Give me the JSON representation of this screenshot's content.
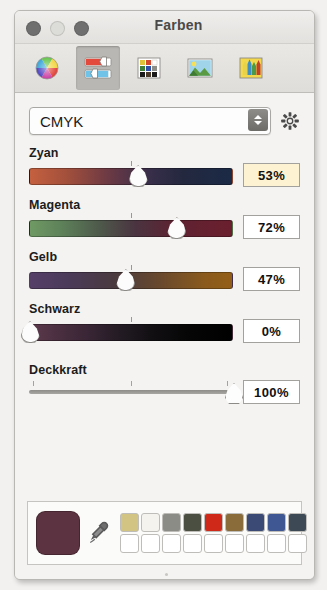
{
  "window": {
    "title": "Farben",
    "controls": [
      {
        "name": "close",
        "color": "#6f6f6f"
      },
      {
        "name": "minimize",
        "color": "#dcdcd8"
      },
      {
        "name": "zoom",
        "color": "#6f6f6f"
      }
    ]
  },
  "toolbar": {
    "items": [
      {
        "id": "color-wheel",
        "icon": "color-wheel-icon",
        "selected": false
      },
      {
        "id": "color-sliders",
        "icon": "sliders-icon",
        "selected": true
      },
      {
        "id": "color-palettes",
        "icon": "palette-grid-icon",
        "selected": false
      },
      {
        "id": "image-palettes",
        "icon": "image-icon",
        "selected": false
      },
      {
        "id": "crayons",
        "icon": "crayons-icon",
        "selected": false
      }
    ]
  },
  "model_selector": {
    "value": "CMYK",
    "options": [
      "Graustufen",
      "RGB-Schieberegler",
      "CMYK",
      "HSB-Schieberegler"
    ],
    "gear_icon": "gear-icon"
  },
  "sliders": [
    {
      "label": "Zyan",
      "value": "53%",
      "percent": 53,
      "focused": true,
      "gradient": "linear-gradient(to right, #c4603f 0%, #a3503c 18%, #6e3a44 38%, #3a2f4a 58%, #23283f 76%, #1b2a46 100%)"
    },
    {
      "label": "Magenta",
      "value": "72%",
      "percent": 72,
      "focused": false,
      "gradient": "linear-gradient(to right, #6f9a64 0%, #5d8059 16%, #4e5a4b 34%, #4a3440 52%, #5e2231 72%, #6b1f2e 100%)"
    },
    {
      "label": "Gelb",
      "value": "47%",
      "percent": 47,
      "focused": false,
      "gradient": "linear-gradient(to right, #553f68 0%, #4a3a58 20%, #4a3a3e 42%, #6b4a2c 66%, #8a5a1d 86%, #935e16 100%)"
    },
    {
      "label": "Schwarz",
      "value": "0%",
      "percent": 0,
      "focused": false,
      "gradient": "linear-gradient(to right, #5c3a4c 0%, #4a2f40 14%, #3a2636 28%, #211a22 46%, #100e11 62%, #050505 80%, #000000 100%)"
    }
  ],
  "opacity": {
    "label": "Deckkraft",
    "value": "100%",
    "percent": 100,
    "ticks": [
      2,
      50,
      97
    ]
  },
  "swatch_bar": {
    "preview_color": "#5c3340",
    "dropper_icon": "eyedropper-icon",
    "row_filled": [
      "#d2c482",
      "#f4f3ee",
      "#8c8c86",
      "#4a4f42",
      "#cf2a19",
      "#8a6b3a",
      "#3b4a74",
      "#3f5894",
      "#3d4a55"
    ],
    "row_empty": [
      "#ffffff",
      "#ffffff",
      "#ffffff",
      "#ffffff",
      "#ffffff",
      "#ffffff",
      "#ffffff",
      "#ffffff",
      "#ffffff"
    ]
  }
}
